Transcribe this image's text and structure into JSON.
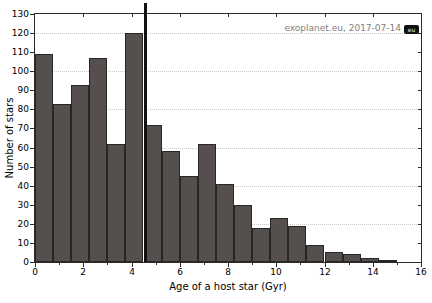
{
  "figure": {
    "watermark_text": "exoplanet.eu, 2017-07-14",
    "watermark_badge": "eu"
  },
  "chart_data": {
    "type": "bar",
    "subtype": "histogram",
    "title": "",
    "xlabel": "Age of a host star (Gyr)",
    "ylabel": "Number of stars",
    "xlim": [
      0,
      16
    ],
    "ylim": [
      0,
      130
    ],
    "x_tick_step": 2,
    "x_minor_tick_step": 1,
    "y_tick_step": 10,
    "grid_step": 20,
    "grid": "horizontal-dotted",
    "legend": "none",
    "bin_start": 0,
    "bin_width": 0.75,
    "bin_left_edges": [
      0,
      0.75,
      1.5,
      2.25,
      3,
      3.75,
      4.5,
      5.25,
      6,
      6.75,
      7.5,
      8.25,
      9,
      9.75,
      10.5,
      11.25,
      12,
      12.75,
      13.5,
      14.25
    ],
    "counts": [
      109,
      83,
      93,
      107,
      62,
      120,
      72,
      58,
      45,
      62,
      41,
      30,
      18,
      23,
      19,
      9,
      5,
      4,
      2,
      1
    ],
    "marker_line": {
      "x": 4.6,
      "clipped_at_top": true
    },
    "bar_color": "#55504e",
    "bar_edge_color": "#272727",
    "grid_color": "#c9c9c9",
    "axis_color": "#2b2b2b",
    "watermark_color": "#7f7f7f"
  }
}
